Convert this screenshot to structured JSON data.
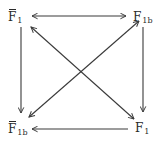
{
  "diagram": {
    "type": "commutative-square",
    "nodes": {
      "top_left": {
        "base": "F",
        "sub": "1",
        "bar": true,
        "label": "F̄1"
      },
      "top_right": {
        "base": "F",
        "sub": "1b",
        "bar": false,
        "label": "F1b"
      },
      "bottom_left": {
        "base": "F",
        "sub": "1b",
        "bar": true,
        "label": "F̄1b"
      },
      "bottom_right": {
        "base": "F",
        "sub": "1",
        "bar": false,
        "label": "F1"
      }
    },
    "edges": [
      {
        "from": "top_left",
        "to": "top_right",
        "direction": "bidirectional"
      },
      {
        "from": "top_left",
        "to": "bottom_left",
        "direction": "forward"
      },
      {
        "from": "top_right",
        "to": "bottom_right",
        "direction": "forward"
      },
      {
        "from": "bottom_right",
        "to": "bottom_left",
        "direction": "forward"
      },
      {
        "from": "top_left",
        "to": "bottom_right",
        "direction": "bidirectional"
      },
      {
        "from": "top_right",
        "to": "bottom_left",
        "direction": "bidirectional"
      }
    ],
    "colors": {
      "ink": "#2a2a2a",
      "background": "#ffffff"
    }
  }
}
